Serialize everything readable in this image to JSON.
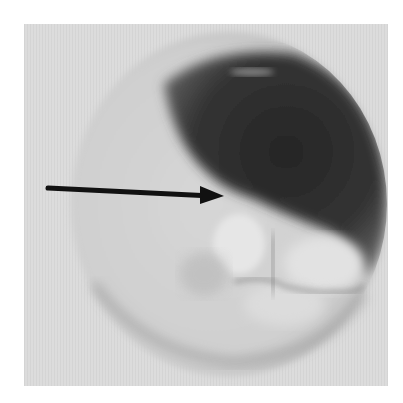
{
  "image": {
    "description": "Grayscale circular endoscopic/ophthalmic-style photograph with a black arrow pointing at a lesion boundary",
    "colors": {
      "page_background": "#ffffff",
      "photo_background": "#dcdcdc",
      "disc_light": "#d0d0d0",
      "dark_region": "#2e2e2e",
      "arrow": "#111111"
    },
    "annotations": [
      {
        "type": "arrow",
        "direction": "right",
        "from": [
          48,
          187
        ],
        "to": [
          223,
          196
        ]
      }
    ]
  }
}
